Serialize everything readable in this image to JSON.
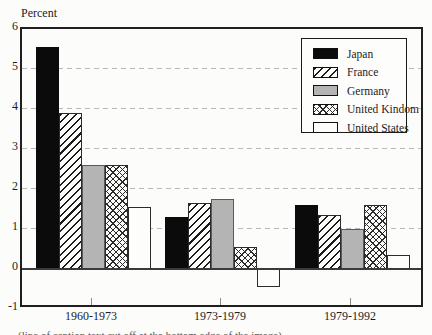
{
  "page": {
    "background": "#fcfcfa"
  },
  "chart_data": {
    "type": "bar",
    "title": "",
    "ylabel": "Percent",
    "xlabel": "",
    "categories": [
      "1960-1973",
      "1973-1979",
      "1979-1992"
    ],
    "series": [
      {
        "name": "Japan",
        "pattern": "solid-black",
        "values": [
          5.55,
          1.3,
          1.6
        ]
      },
      {
        "name": "France",
        "pattern": "diagonal-hatch",
        "values": [
          3.9,
          1.65,
          1.35
        ]
      },
      {
        "name": "Germany",
        "pattern": "solid-gray",
        "values": [
          2.6,
          1.75,
          1.0
        ]
      },
      {
        "name": "United Kindom",
        "pattern": "crosshatch",
        "values": [
          2.6,
          0.55,
          1.6
        ]
      },
      {
        "name": "United States",
        "pattern": "solid-white",
        "values": [
          1.55,
          -0.45,
          0.35
        ]
      }
    ],
    "ylim": [
      -1,
      6
    ],
    "yticks": [
      6,
      5,
      4,
      3,
      2,
      1,
      0,
      -1
    ],
    "grid": "dashed horizontal gridlines at 1 through 5",
    "legend_position": "upper right"
  },
  "colors": {
    "japan_black": "#0b0b0b",
    "germany_gray": "#b4b4b4",
    "bar_outline": "#2b2b2b",
    "gridline": "#b9b9b9",
    "frame": "#1f1f1f",
    "zero_line": "#3a3a3a"
  },
  "caption": {
    "clipped_text": "(line of caption text cut off at the bottom edge of the image)"
  }
}
